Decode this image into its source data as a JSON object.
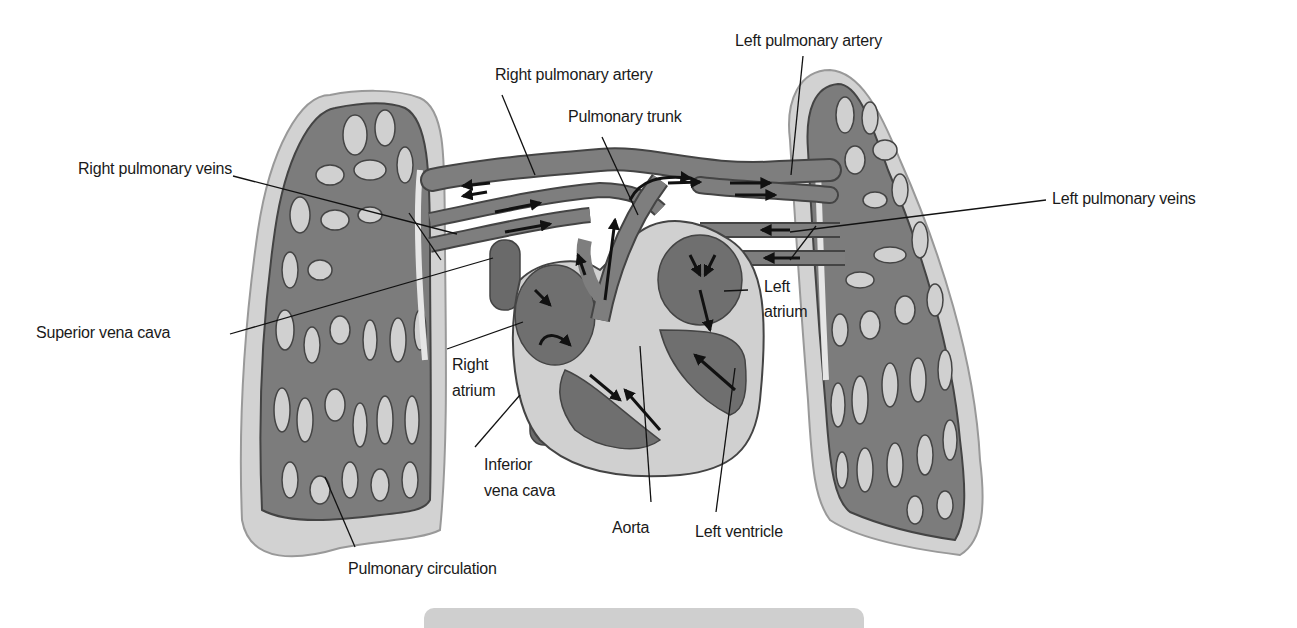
{
  "colors": {
    "vessel": "#7a7a7a",
    "vessel_dark": "#5e5e5e",
    "lung_fill": "#c9c9c9",
    "lung_border": "#a8a8a8",
    "heart_chamber": "#6f6f6f",
    "heart_wall": "#cdcdcd",
    "arrow": "#111111",
    "leader": "#111111",
    "bottom_bar": "#cfcfcf"
  },
  "labels": {
    "left_pulmonary_artery": "Left pulmonary artery",
    "right_pulmonary_artery": "Right pulmonary artery",
    "pulmonary_trunk": "Pulmonary trunk",
    "right_pulmonary_veins": "Right pulmonary veins",
    "left_pulmonary_veins": "Left pulmonary veins",
    "superior_vena_cava": "Superior vena cava",
    "left_atrium_line1": "Left",
    "left_atrium_line2": "atrium",
    "right_atrium_line1": "Right",
    "right_atrium_line2": "atrium",
    "inferior_vena_cava_line1": "Inferior",
    "inferior_vena_cava_line2": "vena cava",
    "aorta": "Aorta",
    "left_ventricle": "Left ventricle",
    "pulmonary_circulation": "Pulmonary circulation"
  }
}
